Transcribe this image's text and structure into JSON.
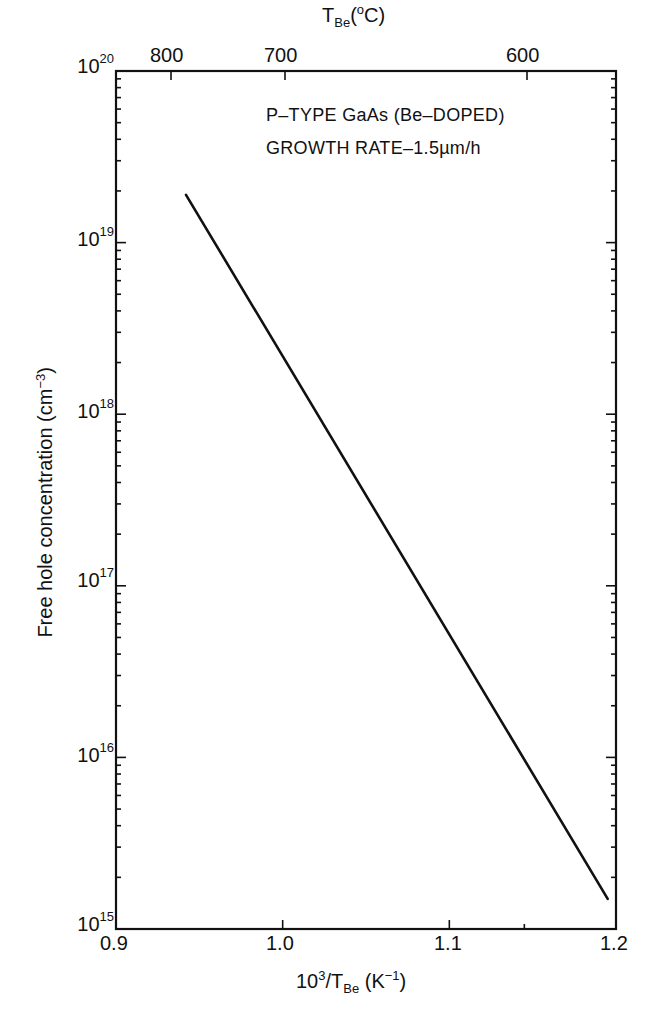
{
  "chart_data": {
    "type": "line",
    "title": "",
    "annotations": [
      "P-TYPE GaAs (Be-DOPED)",
      "GROWTH RATE-1.5µm/h"
    ],
    "xlabel": "10^3/T_Be (K^-1)",
    "x2label": "T_Be (°C)",
    "ylabel": "Free hole concentration (cm^-3)",
    "xlim": [
      0.9,
      1.2
    ],
    "ylim": [
      1000000000000000.0,
      1e+20
    ],
    "yscale": "log",
    "grid": false,
    "legend": null,
    "x_ticks": [
      0.9,
      1.0,
      1.1,
      1.2
    ],
    "x_tick_labels": [
      "0.9",
      "1.0",
      "1.1",
      "1.2"
    ],
    "x2_ticks": [
      800,
      700,
      600
    ],
    "x2_tick_labels": [
      "800",
      "700",
      "600"
    ],
    "y_ticks": [
      1000000000000000.0,
      1e+16,
      1e+17,
      1e+18,
      1e+19,
      1e+20
    ],
    "y_tick_labels": [
      "10^15",
      "10^16",
      "10^17",
      "10^18",
      "10^19",
      "10^20"
    ],
    "series": [
      {
        "name": "Free hole concentration",
        "x": [
          0.942,
          1.0,
          1.05,
          1.1,
          1.15,
          1.195
        ],
        "y": [
          1.9e+19,
          2.6e+18,
          5e+17,
          9.3e+16,
          1.7e+16,
          1500000000000000.0
        ]
      }
    ]
  },
  "labels": {
    "note_line1": "P–TYPE GaAs  (Be–DOPED)",
    "note_line2": "GROWTH RATE–1.5µm/h",
    "x_title_main": "10",
    "x_title_sup": "3",
    "x_title_mid": "/T",
    "x_title_sub": "Be",
    "x_title_unit": " (K",
    "x_title_unit_sup": "−1",
    "x_title_close": ")",
    "x2_title_main": "T",
    "x2_title_sub": "Be",
    "x2_title_rest": "(",
    "x2_title_sup": "o",
    "x2_title_close": "C)",
    "y_title": "Free hole concentration (cm",
    "y_title_sup": "−3",
    "y_title_close": ")",
    "x_ticks": [
      "0.9",
      "1.0",
      "1.1",
      "1.2"
    ],
    "x2_ticks": [
      "800",
      "700",
      "600"
    ],
    "y_base": "10",
    "y_exps": [
      "20",
      "19",
      "18",
      "17",
      "16",
      "15"
    ]
  }
}
